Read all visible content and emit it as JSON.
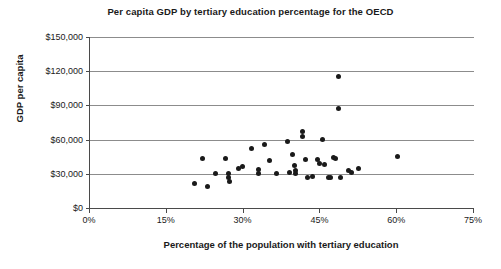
{
  "chart_data": {
    "type": "scatter",
    "title": "Per capita GDP by tertiary education percentage for the OECD",
    "xlabel": "Percentage of the population with tertiary education",
    "ylabel": "GDP per capita",
    "xlim": [
      0,
      75
    ],
    "ylim": [
      0,
      150000
    ],
    "xticks": [
      0,
      15,
      30,
      45,
      60,
      75
    ],
    "xtick_labels": [
      "0%",
      "15%",
      "30%",
      "45%",
      "60%",
      "75%"
    ],
    "yticks": [
      0,
      30000,
      60000,
      90000,
      120000,
      150000
    ],
    "ytick_labels": [
      "$0",
      "$30,000",
      "$60,000",
      "$90,000",
      "$120,000",
      "$150,000"
    ],
    "grid": "horizontal",
    "legend": "none",
    "marker_color": "#1a1a1a",
    "points": [
      {
        "x": 20.5,
        "y": 21500
      },
      {
        "x": 22.0,
        "y": 43500
      },
      {
        "x": 23.0,
        "y": 18500
      },
      {
        "x": 24.5,
        "y": 30500
      },
      {
        "x": 26.5,
        "y": 43000
      },
      {
        "x": 27.0,
        "y": 30000
      },
      {
        "x": 27.0,
        "y": 27000
      },
      {
        "x": 27.2,
        "y": 23000
      },
      {
        "x": 29.0,
        "y": 34500
      },
      {
        "x": 29.8,
        "y": 36500
      },
      {
        "x": 31.5,
        "y": 52500
      },
      {
        "x": 33.0,
        "y": 33500
      },
      {
        "x": 33.0,
        "y": 30500
      },
      {
        "x": 34.0,
        "y": 55500
      },
      {
        "x": 35.0,
        "y": 41500
      },
      {
        "x": 36.5,
        "y": 30000
      },
      {
        "x": 38.5,
        "y": 58500
      },
      {
        "x": 39.0,
        "y": 31000
      },
      {
        "x": 39.5,
        "y": 46500
      },
      {
        "x": 40.0,
        "y": 37000
      },
      {
        "x": 40.2,
        "y": 33000
      },
      {
        "x": 40.2,
        "y": 30000
      },
      {
        "x": 41.5,
        "y": 67000
      },
      {
        "x": 41.5,
        "y": 63000
      },
      {
        "x": 42.0,
        "y": 42500
      },
      {
        "x": 42.5,
        "y": 26500
      },
      {
        "x": 43.5,
        "y": 27500
      },
      {
        "x": 44.5,
        "y": 42500
      },
      {
        "x": 44.8,
        "y": 39000
      },
      {
        "x": 45.5,
        "y": 60000
      },
      {
        "x": 45.8,
        "y": 38500
      },
      {
        "x": 46.5,
        "y": 27000
      },
      {
        "x": 47.0,
        "y": 26500
      },
      {
        "x": 47.5,
        "y": 44500
      },
      {
        "x": 48.0,
        "y": 43500
      },
      {
        "x": 48.5,
        "y": 115000
      },
      {
        "x": 48.5,
        "y": 87000
      },
      {
        "x": 49.0,
        "y": 26500
      },
      {
        "x": 50.5,
        "y": 32500
      },
      {
        "x": 51.0,
        "y": 31500
      },
      {
        "x": 52.5,
        "y": 34500
      },
      {
        "x": 60.0,
        "y": 45000
      }
    ]
  }
}
